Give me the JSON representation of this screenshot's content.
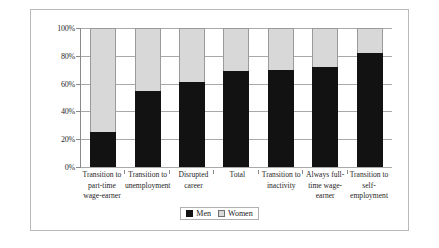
{
  "chart_data": {
    "type": "bar",
    "stacked": true,
    "normalized_percent": true,
    "title": "",
    "xlabel": "",
    "ylabel": "",
    "ylim": [
      0,
      100
    ],
    "yticks": [
      "0%",
      "20%",
      "40%",
      "60%",
      "80%",
      "100%"
    ],
    "ytick_values": [
      0,
      20,
      40,
      60,
      80,
      100
    ],
    "grid": true,
    "legend_position": "bottom-center",
    "categories": [
      "Transition to part-time wage-earner",
      "Transition to unemployment",
      "Disrupted career",
      "Total",
      "Transition to inactivity",
      "Always full-time wage-earner",
      "Transition to self-employment"
    ],
    "category_lines": [
      [
        "Transition to",
        "part-time",
        "wage-earner"
      ],
      [
        "Transition to",
        "unemployment"
      ],
      [
        "Disrupted",
        "career"
      ],
      [
        "Total"
      ],
      [
        "Transition to",
        "inactivity"
      ],
      [
        "Always full-",
        "time wage-",
        "earner"
      ],
      [
        "Transition to",
        "self-",
        "employment"
      ]
    ],
    "series": [
      {
        "name": "Men",
        "color": "#121212",
        "values": [
          25,
          55,
          61,
          69,
          70,
          72,
          82
        ]
      },
      {
        "name": "Women",
        "color": "#d8d8d8",
        "values": [
          75,
          45,
          39,
          31,
          30,
          28,
          18
        ]
      }
    ]
  }
}
